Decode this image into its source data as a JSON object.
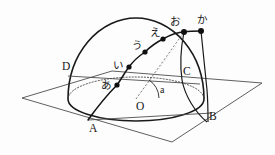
{
  "figure": {
    "stroke_color": "#1a1a1a",
    "dot_color": "#101010",
    "plane_color": "#4a4a4a",
    "dashed_color": "#606060",
    "background": "#fdfdfd"
  },
  "labels": {
    "point_A": "A",
    "point_B": "B",
    "point_C": "C",
    "point_D": "D",
    "center_O": "O",
    "angle_a": "a",
    "path_1": "あ",
    "path_2": "い",
    "path_3": "う",
    "path_4": "え",
    "path_5": "お",
    "path_6": "か"
  },
  "geometry": {
    "center": {
      "x": 136,
      "y": 99
    },
    "radius": 68,
    "dome_top_y": 18,
    "equator_rx": 68,
    "equator_ry": 22,
    "plane_corners": [
      {
        "name": "left",
        "x": 22,
        "y": 98
      },
      {
        "name": "top",
        "x": 112,
        "y": 71
      },
      {
        "name": "right",
        "x": 262,
        "y": 83
      },
      {
        "name": "bottom",
        "x": 172,
        "y": 142
      }
    ],
    "points": [
      {
        "name": "A",
        "x": 88,
        "y": 120
      },
      {
        "name": "B",
        "x": 208,
        "y": 122
      },
      {
        "name": "C",
        "x": 186,
        "y": 86
      },
      {
        "name": "D",
        "x": 68,
        "y": 76
      },
      {
        "name": "O",
        "x": 136,
        "y": 99
      }
    ],
    "path_dots": [
      {
        "label": "あ",
        "x": 117,
        "y": 85
      },
      {
        "label": "い",
        "x": 129,
        "y": 67
      },
      {
        "label": "う",
        "x": 145,
        "y": 52
      },
      {
        "label": "え",
        "x": 163,
        "y": 39
      },
      {
        "label": "お",
        "x": 184,
        "y": 32
      },
      {
        "label": "か",
        "x": 201,
        "y": 31
      }
    ]
  }
}
